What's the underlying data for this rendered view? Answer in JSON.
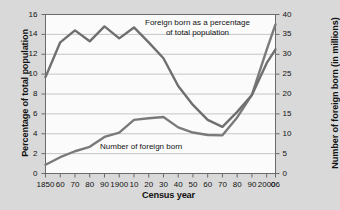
{
  "chart_data": {
    "type": "line",
    "title": "",
    "xlabel": "Census year",
    "ylabel": "Percentage of total population",
    "y2label": "Number of foreign born (in millions)",
    "xlim": [
      1850,
      2006
    ],
    "ylim": [
      0,
      16
    ],
    "y2lim": [
      0,
      40
    ],
    "grid": true,
    "legend_position": "inline-annotations",
    "x_tick_labels": [
      "1850",
      "60",
      "70",
      "80",
      "90",
      "1900",
      "10",
      "20",
      "30",
      "40",
      "50",
      "60",
      "70",
      "80",
      "90",
      "2000",
      "06"
    ],
    "x_tick_values": [
      1850,
      1860,
      1870,
      1880,
      1890,
      1900,
      1910,
      1920,
      1930,
      1940,
      1950,
      1960,
      1970,
      1980,
      1990,
      2000,
      2006
    ],
    "y_tick_labels": [
      "0",
      "2",
      "4",
      "6",
      "8",
      "10",
      "12",
      "14",
      "16"
    ],
    "y_tick_values": [
      0,
      2,
      4,
      6,
      8,
      10,
      12,
      14,
      16
    ],
    "y2_tick_labels": [
      "0",
      "5",
      "10",
      "15",
      "20",
      "25",
      "30",
      "35",
      "40"
    ],
    "y2_tick_values": [
      0,
      5,
      10,
      15,
      20,
      25,
      30,
      35,
      40
    ],
    "annotations": [
      {
        "name": "percentage-series-label",
        "line1": "Foreign born as a percentage",
        "line2": "of total population"
      },
      {
        "name": "number-series-label",
        "line1": "Number of foreign born",
        "line2": ""
      }
    ],
    "series": [
      {
        "name": "Foreign born as a percentage of total population",
        "axis": "left",
        "unit": "percent",
        "color": "#6f6f6f",
        "x": [
          1850,
          1860,
          1870,
          1880,
          1890,
          1900,
          1910,
          1920,
          1930,
          1940,
          1950,
          1960,
          1970,
          1980,
          1990,
          2000,
          2006
        ],
        "values": [
          9.7,
          13.2,
          14.4,
          13.3,
          14.8,
          13.6,
          14.7,
          13.2,
          11.6,
          8.8,
          6.9,
          5.4,
          4.7,
          6.2,
          7.9,
          11.1,
          12.5
        ]
      },
      {
        "name": "Number of foreign born",
        "axis": "right",
        "unit": "millions",
        "color": "#7a7a7a",
        "x": [
          1850,
          1860,
          1870,
          1880,
          1890,
          1900,
          1910,
          1920,
          1930,
          1940,
          1950,
          1960,
          1970,
          1980,
          1990,
          2000,
          2006
        ],
        "values": [
          2.2,
          4.1,
          5.6,
          6.7,
          9.2,
          10.3,
          13.5,
          13.9,
          14.2,
          11.6,
          10.3,
          9.7,
          9.6,
          14.1,
          19.8,
          31.1,
          37.5
        ]
      }
    ]
  },
  "axis_titles": {
    "left": "Percentage of total population",
    "right": "Number of foreign born (in millions)",
    "bottom": "Census year"
  },
  "colors": {
    "background": "#d9d9d9",
    "plot_background": "#fbfbfb",
    "gridline": "#b9b9b9",
    "frame": "#6a6a6a",
    "series_percentage": "#6f6f6f",
    "series_number": "#7a7a7a",
    "text": "#111111"
  }
}
